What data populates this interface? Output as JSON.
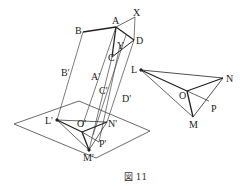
{
  "figure": {
    "caption": "図 11",
    "upper_labels": {
      "A": "A",
      "B": "B",
      "X": "X",
      "Y": "Y",
      "C": "C",
      "D": "D",
      "A_prime": "A'",
      "B_prime": "B'",
      "C_prime": "C'",
      "D_prime": "D'"
    },
    "projection_labels": {
      "L_prime": "L'",
      "O_prime": "O'",
      "N_prime": "N'",
      "P_prime": "P'",
      "M_prime": "M'"
    },
    "triangle_labels": {
      "L": "L",
      "O": "O",
      "N": "N",
      "P": "P",
      "M": "M"
    },
    "colors": {
      "stroke": "#222222",
      "thin_stroke": "#555555",
      "background": "#ffffff"
    }
  }
}
